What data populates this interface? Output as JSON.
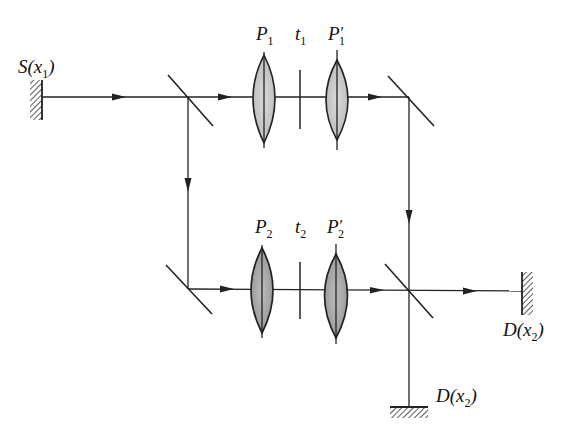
{
  "diagram": {
    "type": "optical-interferometer-schematic",
    "colors": {
      "line": "#222222",
      "lens_fill_top": "#c9c9c9",
      "lens_fill_bottom": "#a9a9a9",
      "background": "#ffffff"
    },
    "source": {
      "label_main": "S(x",
      "label_sub": "1",
      "label_close": ")"
    },
    "upper_arm": {
      "lens_in": {
        "label_main": "P",
        "label_sub": "1",
        "label_prime": ""
      },
      "plate": {
        "label_main": "t",
        "label_sub": "1"
      },
      "lens_out": {
        "label_main": "P",
        "label_sub": "1",
        "label_prime": "′"
      }
    },
    "lower_arm": {
      "lens_in": {
        "label_main": "P",
        "label_sub": "2",
        "label_prime": ""
      },
      "plate": {
        "label_main": "t",
        "label_sub": "2"
      },
      "lens_out": {
        "label_main": "P",
        "label_sub": "2",
        "label_prime": "′"
      }
    },
    "detector_right": {
      "label_main": "D(x",
      "label_sub": "2",
      "label_close": ")"
    },
    "detector_bottom": {
      "label_main": "D(x",
      "label_sub": "2",
      "label_close": ")"
    }
  }
}
